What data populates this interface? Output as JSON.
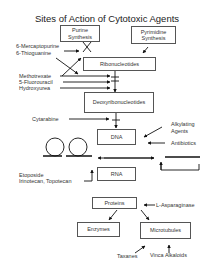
{
  "title": "Sites of Action of Cytotoxic Agents",
  "boxes": {
    "purine": [
      "Purine",
      "Synthesis"
    ],
    "pyrimidine": [
      "Pyrimidine",
      "Synthesis"
    ],
    "ribonucleotides": "Ribonucleotides",
    "deoxyribonucleotides": "Deoxyribonucleotides",
    "dna": "DNA",
    "rna": "RNA",
    "proteins": "Proteins",
    "enzymes": "Enzymes",
    "microtubules": "Microtubules"
  },
  "agents": {
    "mercaptopurine": "6-Mercaptopurine",
    "thioguanine": "6-Thioguanine",
    "methotrexate": "Methotrexate",
    "fluorouracil": "5-Fluorouracil",
    "hydroxyurea": "Hydroxyurea",
    "cytarabine": "Cytarabine",
    "alkylating": [
      "Alkylating",
      "Agents"
    ],
    "antibiotics": "Antibiotics",
    "etoposide": "Etoposide",
    "irinotecan": "Irinotecan, Topotecan",
    "asparaginase": "L-Asparaginase",
    "taxanes": "Taxanes",
    "vinca": "Vinca Alkaloids"
  }
}
